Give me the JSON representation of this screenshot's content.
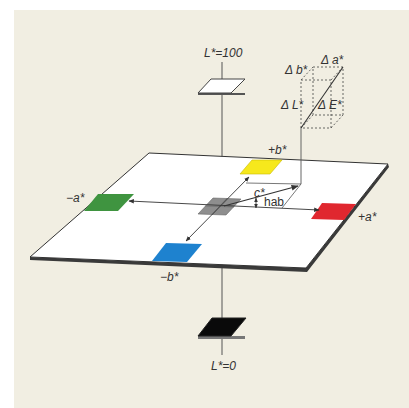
{
  "diagram": {
    "colors": {
      "background": "#f1eee2",
      "plane": "#ffffff",
      "plane_edge": "#333333",
      "white_patch": "#ffffff",
      "black_patch": "#0a0a0a",
      "gray_patch": "#8e8e8e",
      "yellow": "#f6e81c",
      "green": "#3f9440",
      "red": "#e0272f",
      "blue": "#1e82cf"
    },
    "labels": {
      "l_top": "L*=100",
      "l_bottom": "L*=0",
      "plus_a": "+a*",
      "minus_a": "−a*",
      "plus_b": "+b*",
      "minus_b": "−b*",
      "chroma": "c*",
      "hue": "hab",
      "delta_a": "Δ a*",
      "delta_b": "Δ b*",
      "delta_l": "Δ L*",
      "delta_e": "Δ E*"
    }
  }
}
